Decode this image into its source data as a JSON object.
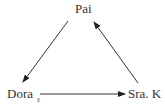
{
  "diagram": {
    "nodes": {
      "top": {
        "label": "Pai"
      },
      "left": {
        "label": "Dora",
        "symbol": "♀"
      },
      "right": {
        "label": "Sra. K"
      }
    },
    "edges": [
      {
        "from": "Pai",
        "to": "Dora"
      },
      {
        "from": "Dora",
        "to": "Sra. K"
      },
      {
        "from": "Sra. K",
        "to": "Pai"
      }
    ],
    "colors": {
      "line": "#333333",
      "text": "#333333"
    }
  }
}
